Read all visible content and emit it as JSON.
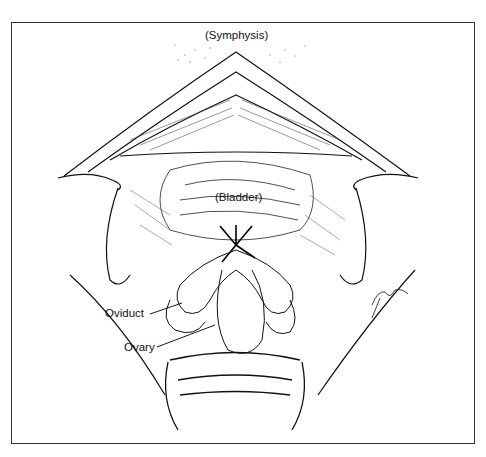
{
  "figure": {
    "type": "surgical-illustration",
    "style": "black-and-white pen-and-ink",
    "colors": {
      "ink": "#111111",
      "background": "#ffffff",
      "frame": "#333333"
    }
  },
  "labels": {
    "symphysis": "(Symphysis)",
    "bladder": "(Bladder)",
    "oviduct": "Oviduct",
    "ovary": "Ovary"
  }
}
